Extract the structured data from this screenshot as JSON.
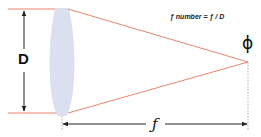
{
  "diagram": {
    "formula": "ƒ number = ƒ / D",
    "diameter_label": "D",
    "focal_length_label": "ƒ",
    "focal_point_symbol": "ϕ",
    "colors": {
      "rays": "#e8866a",
      "lens": "#dcdff0",
      "arrows": "#222222",
      "focal_dashed_line": "#aaaaaa"
    }
  }
}
